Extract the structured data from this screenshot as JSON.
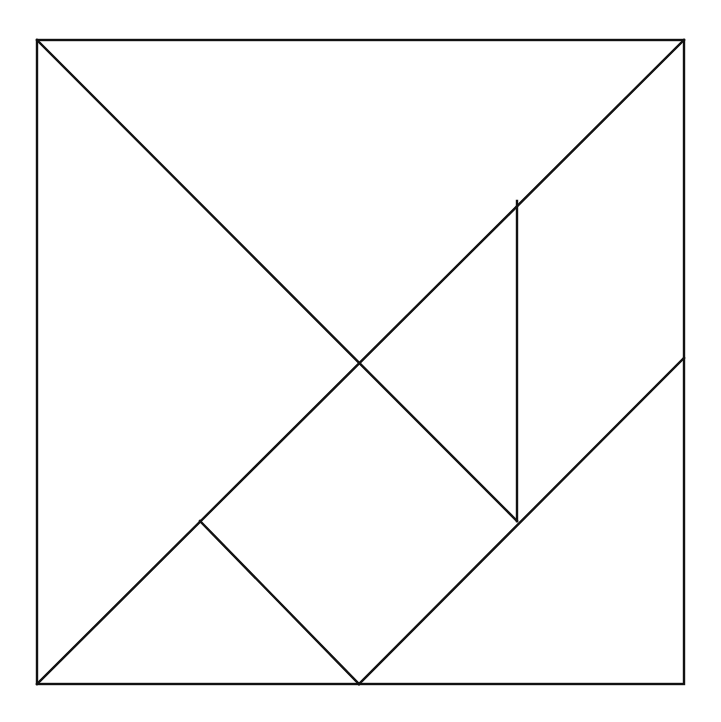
{
  "diagram": {
    "type": "tangram",
    "background": "#ffffff",
    "line_color": "#111111",
    "outer_square": {
      "x1": 37,
      "y1": 40,
      "x2": 684,
      "y2": 684
    },
    "pieces": [
      {
        "name": "large-triangle-top",
        "points": [
          [
            37,
            40
          ],
          [
            684,
            40
          ],
          [
            359,
            361
          ]
        ]
      },
      {
        "name": "large-triangle-left",
        "points": [
          [
            37,
            40
          ],
          [
            359,
            361
          ],
          [
            37,
            684
          ]
        ]
      },
      {
        "name": "medium-triangle-bottom-right",
        "points": [
          [
            359,
            684
          ],
          [
            684,
            684
          ],
          [
            684,
            358
          ]
        ]
      },
      {
        "name": "small-triangle-bottom-left",
        "points": [
          [
            37,
            684
          ],
          [
            200,
            521
          ],
          [
            359,
            684
          ]
        ]
      },
      {
        "name": "small-triangle-middle",
        "points": [
          [
            359,
            361
          ],
          [
            517,
            201
          ],
          [
            517,
            521
          ]
        ]
      },
      {
        "name": "square",
        "points": [
          [
            200,
            521
          ],
          [
            359,
            361
          ],
          [
            517,
            521
          ],
          [
            359,
            684
          ]
        ]
      },
      {
        "name": "parallelogram",
        "points": [
          [
            517,
            201
          ],
          [
            684,
            40
          ],
          [
            684,
            358
          ],
          [
            517,
            521
          ]
        ]
      }
    ],
    "lines": [
      {
        "name": "diagonal-main",
        "x1": 37,
        "y1": 40,
        "x2": 517,
        "y2": 521
      },
      {
        "name": "diagonal-anti",
        "x1": 684,
        "y1": 40,
        "x2": 37,
        "y2": 684
      },
      {
        "name": "vertical-divider",
        "x1": 517,
        "y1": 201,
        "x2": 517,
        "y2": 521
      },
      {
        "name": "lower-diagonal",
        "x1": 684,
        "y1": 358,
        "x2": 359,
        "y2": 684
      },
      {
        "name": "square-left-edge",
        "x1": 200,
        "y1": 521,
        "x2": 359,
        "y2": 684
      }
    ]
  }
}
